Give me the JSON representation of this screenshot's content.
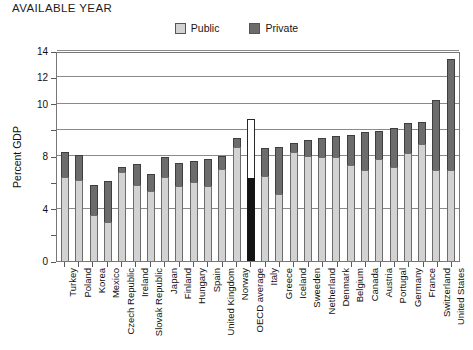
{
  "heading": "AVAILABLE YEAR",
  "legend": {
    "position": "top-center",
    "items": [
      {
        "label": "Public",
        "color": "#d2d2d2",
        "swatch_name": "public-swatch"
      },
      {
        "label": "Private",
        "color": "#6c6c6c",
        "swatch_name": "private-swatch"
      }
    ]
  },
  "chart_data": {
    "type": "bar",
    "subtype": "stacked",
    "title": "AVAILABLE YEAR",
    "xlabel": "",
    "ylabel": "Percent GDP",
    "ylim": [
      0,
      16
    ],
    "ytick_values": [
      0,
      2,
      4,
      6,
      8,
      10,
      12,
      14,
      16
    ],
    "ytick_labels": [
      "0",
      "",
      "4",
      "",
      "8",
      "",
      "10",
      "12",
      "14",
      "16"
    ],
    "ytick_labels_shown": [
      "0",
      "4",
      "8",
      "10",
      "12",
      "14",
      "16"
    ],
    "grid": true,
    "gridline_values": [
      4,
      8,
      10,
      12,
      14,
      16
    ],
    "legend_position": "top-center",
    "highlight_category": "OECD average",
    "categories": [
      "Turkey",
      "Poland",
      "Korea",
      "Mexico",
      "Czech Republic",
      "Ireland",
      "Slovak Republic",
      "Japan",
      "Finland",
      "Hungary",
      "Spain",
      "United Kingdom",
      "Norway",
      "OECD average",
      "Italy",
      "Greece",
      "Iceland",
      "Sweeden",
      "Netherland",
      "Denmark",
      "Belgium",
      "Canada",
      "Austria",
      "Portugal",
      "Germany",
      "France",
      "Switzerland",
      "United States"
    ],
    "series": [
      {
        "name": "Public",
        "color": "#d2d2d2",
        "values": [
          6.4,
          6.2,
          3.5,
          3.0,
          6.8,
          5.8,
          5.3,
          6.4,
          5.7,
          6.0,
          5.7,
          7.0,
          8.7,
          6.3,
          6.5,
          5.1,
          8.3,
          8.0,
          7.9,
          7.9,
          7.3,
          6.9,
          7.8,
          7.2,
          8.2,
          8.9,
          6.9,
          6.9
        ],
        "unit": "% of GDP"
      },
      {
        "name": "Private",
        "color": "#6c6c6c",
        "values": [
          1.9,
          1.9,
          2.3,
          3.1,
          0.4,
          1.6,
          1.3,
          1.5,
          1.8,
          1.6,
          2.1,
          1.0,
          0.7,
          4.5,
          2.1,
          3.6,
          0.7,
          1.2,
          1.5,
          1.6,
          2.3,
          2.9,
          2.1,
          2.9,
          2.3,
          1.7,
          5.4,
          8.5
        ],
        "unit": "% of GDP"
      }
    ],
    "totals": [
      8.3,
      8.1,
      5.8,
      6.1,
      7.2,
      7.4,
      6.6,
      7.9,
      7.5,
      7.6,
      7.8,
      8.0,
      9.4,
      10.8,
      8.6,
      8.7,
      9.0,
      9.2,
      9.4,
      9.5,
      9.6,
      9.8,
      9.9,
      10.1,
      10.5,
      10.6,
      12.3,
      15.4
    ]
  }
}
